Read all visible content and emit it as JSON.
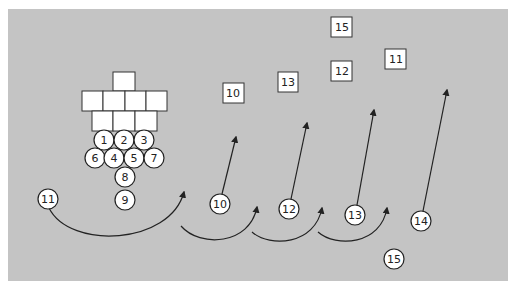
{
  "diagram": {
    "type": "football-play",
    "background_color": "#c4c4c4",
    "formation_blocks": {
      "rows": [
        {
          "count": 1,
          "x": 113,
          "y": 72
        },
        {
          "count": 4,
          "x": 82,
          "y": 91
        },
        {
          "count": 3,
          "x": 92,
          "y": 111
        }
      ],
      "size": 21
    },
    "defense_circles": [
      {
        "label": "1",
        "x": 104,
        "y": 140
      },
      {
        "label": "2",
        "x": 124,
        "y": 140
      },
      {
        "label": "3",
        "x": 144,
        "y": 140
      },
      {
        "label": "6",
        "x": 95,
        "y": 158
      },
      {
        "label": "4",
        "x": 114,
        "y": 158
      },
      {
        "label": "5",
        "x": 134,
        "y": 158
      },
      {
        "label": "7",
        "x": 154,
        "y": 158
      },
      {
        "label": "8",
        "x": 125,
        "y": 177
      },
      {
        "label": "9",
        "x": 125,
        "y": 200
      }
    ],
    "receiver_circles": [
      {
        "label": "11",
        "x": 48,
        "y": 199
      },
      {
        "label": "10",
        "x": 220,
        "y": 204
      },
      {
        "label": "12",
        "x": 289,
        "y": 209
      },
      {
        "label": "13",
        "x": 355,
        "y": 215
      },
      {
        "label": "14",
        "x": 421,
        "y": 221
      },
      {
        "label": "15",
        "x": 394,
        "y": 259
      }
    ],
    "target_squares": [
      {
        "label": "15",
        "x": 342,
        "y": 27
      },
      {
        "label": "12",
        "x": 342,
        "y": 71
      },
      {
        "label": "11",
        "x": 396,
        "y": 59
      },
      {
        "label": "13",
        "x": 288,
        "y": 82
      },
      {
        "label": "10",
        "x": 233,
        "y": 93
      }
    ]
  }
}
